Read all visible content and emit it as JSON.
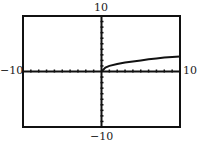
{
  "chart_data": {
    "type": "line",
    "title": "",
    "xlabel": "",
    "ylabel": "",
    "xlim": [
      -10,
      10
    ],
    "ylim": [
      -10,
      10
    ],
    "grid": false,
    "tick_spacing": 1,
    "labels": {
      "top": "10",
      "bottom": "-10",
      "left": "-10",
      "right": "10"
    },
    "series": [
      {
        "name": "curve",
        "x": [
          0,
          0.5,
          1,
          2,
          3,
          4,
          5,
          6,
          7,
          8,
          9,
          10
        ],
        "y": [
          0,
          0.7,
          1.0,
          1.35,
          1.6,
          1.8,
          2.0,
          2.2,
          2.35,
          2.5,
          2.6,
          2.7
        ]
      }
    ]
  }
}
